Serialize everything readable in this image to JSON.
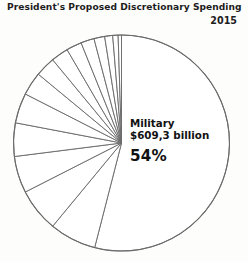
{
  "header": {
    "title": "President's Proposed Discretionary Spending",
    "year": "2015"
  },
  "callout": {
    "category": "Military",
    "amount": "$609,3 billion",
    "percent": "54%"
  },
  "chart_data": {
    "type": "pie",
    "title": "President's Proposed Discretionary Spending",
    "subtitle": "2015",
    "labels": [
      "Military",
      "Slice 2",
      "Slice 3",
      "Slice 4",
      "Slice 5",
      "Slice 6",
      "Slice 7",
      "Slice 8",
      "Slice 9",
      "Slice 10",
      "Slice 11",
      "Slice 12",
      "Slice 13",
      "Slice 14",
      "Slice 15"
    ],
    "values": [
      54,
      7,
      6.5,
      5.5,
      5,
      4.5,
      3.5,
      3,
      2.6,
      2.3,
      2,
      1.6,
      1.2,
      0.8,
      0.5
    ],
    "annotations": [
      "Military",
      "$609,3 billion",
      "54%"
    ],
    "legend": "none",
    "grid": false,
    "start_angle_deg": 0,
    "direction": "clockwise",
    "slice_fill": "#ffffff",
    "slice_stroke": "#6b6b6b",
    "label_color": "#111111"
  },
  "colors": {
    "background": "#fdfdfc",
    "outline": "#6b6b6b",
    "text": "#1d1d1d"
  }
}
